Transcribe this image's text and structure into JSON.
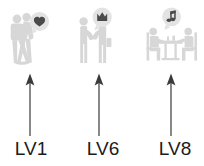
{
  "diagram": {
    "background_color": "#ffffff",
    "figure_color": "#d7d7d7",
    "bubble_color": "#e3e3e3",
    "glyph_color": "#4a4a4a",
    "arrow_color": "#3a3a3a",
    "label_color": "#1c1c1c"
  },
  "levels": [
    {
      "label": "LV1",
      "scene": "couple-dancing",
      "scene_description": "Two people dancing close together",
      "bubble_icon": "heart-icon",
      "bubble_glyph": "♥"
    },
    {
      "label": "LV6",
      "scene": "two-people-facing",
      "scene_description": "Two people standing face to face holding hands",
      "bubble_icon": "crown-icon",
      "bubble_glyph": "♛"
    },
    {
      "label": "LV8",
      "scene": "two-people-dining",
      "scene_description": "Two people seated at a table",
      "bubble_icon": "music-note-icon",
      "bubble_glyph": "♫"
    }
  ]
}
